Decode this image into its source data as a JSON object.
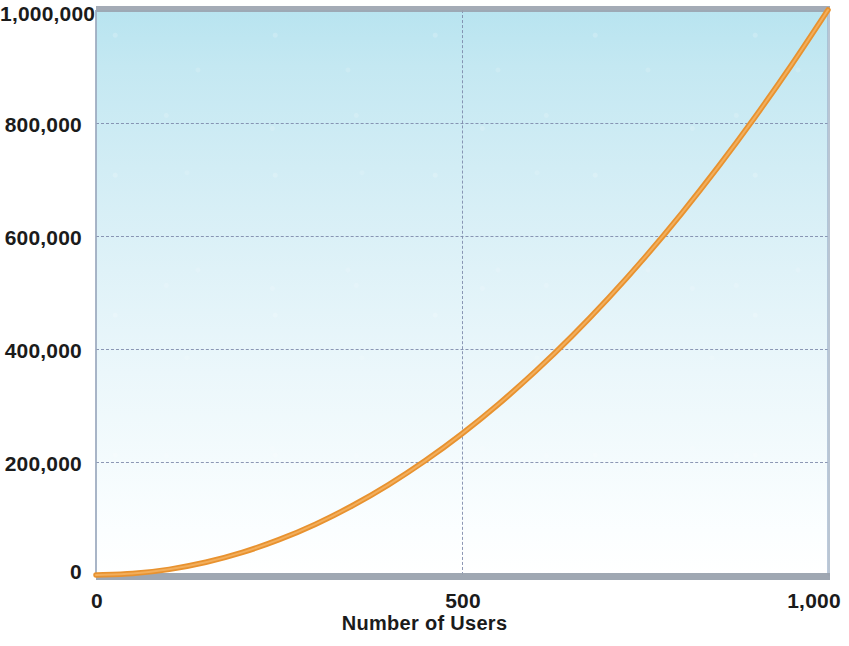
{
  "chart_data": {
    "type": "line",
    "title": "",
    "subtitle": "",
    "xlabel": "Number of Users",
    "ylabel": "",
    "xlim": [
      0,
      1000
    ],
    "ylim": [
      0,
      1000000
    ],
    "grid": true,
    "legend": null,
    "x_ticks": [
      {
        "value": 0,
        "label": "0"
      },
      {
        "value": 500,
        "label": "500"
      },
      {
        "value": 1000,
        "label": "1,000"
      }
    ],
    "y_ticks": [
      {
        "value": 0,
        "label": "0"
      },
      {
        "value": 200000,
        "label": "200,000"
      },
      {
        "value": 400000,
        "label": "400,000"
      },
      {
        "value": 600000,
        "label": "600,000"
      },
      {
        "value": 800000,
        "label": "800,000"
      },
      {
        "value": 1000000,
        "label": "1,000,000"
      }
    ],
    "series": [
      {
        "name": "Number of Connections",
        "color": "#e8922f",
        "line_width": 5,
        "x": [
          0,
          50,
          100,
          150,
          200,
          250,
          300,
          350,
          400,
          450,
          500,
          550,
          600,
          650,
          700,
          750,
          800,
          850,
          900,
          950,
          1000
        ],
        "values": [
          0,
          2500,
          10000,
          22500,
          40000,
          62500,
          90000,
          122500,
          160000,
          202500,
          250000,
          302500,
          360000,
          422500,
          490000,
          562500,
          640000,
          722500,
          810000,
          902500,
          1000000
        ]
      }
    ],
    "relationship": "quadratic"
  },
  "style": {
    "plot_bg_top": "#b8e4f0",
    "plot_bg_bottom": "#ffffff",
    "grid_color": "#7a86a8",
    "axis_color": "#9aa2ae",
    "curve_color": "#e8922f",
    "text_color": "#1b1b1b"
  }
}
